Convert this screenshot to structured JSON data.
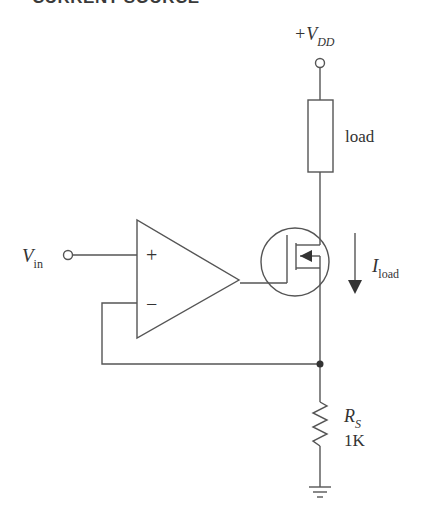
{
  "header": {
    "title": "CURRENT SOURCE"
  },
  "diagram": {
    "supply_label": "+V",
    "supply_sub": "DD",
    "load_label": "load",
    "input_label": "V",
    "input_sub": "in",
    "opamp_plus": "+",
    "opamp_minus": "−",
    "current_label": "I",
    "current_sub": "load",
    "sense_resistor_label": "R",
    "sense_resistor_sub": "S",
    "sense_resistor_value": "1K"
  },
  "colors": {
    "stroke": "#555555",
    "text": "#333333",
    "background": "#ffffff"
  }
}
